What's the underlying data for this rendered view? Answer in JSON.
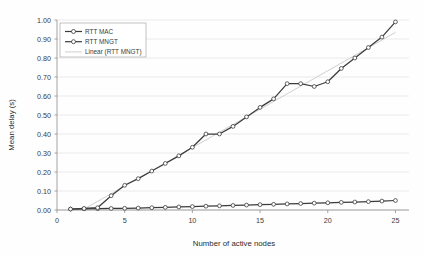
{
  "chart_data": {
    "type": "line",
    "title": "",
    "xlabel": "Number of active nodes",
    "ylabel": "Mean delay (s)",
    "xlim": [
      0,
      26
    ],
    "ylim": [
      0.0,
      1.0
    ],
    "xticks": [
      0,
      5,
      10,
      15,
      20,
      25
    ],
    "xtick_labels": [
      "0",
      "5",
      "10",
      "15",
      "20",
      "25"
    ],
    "yticks": [
      0.0,
      0.1,
      0.2,
      0.3,
      0.4,
      0.5,
      0.6,
      0.7,
      0.8,
      0.9,
      1.0
    ],
    "ytick_labels": [
      "0.00",
      "0.10",
      "0.20",
      "0.30",
      "0.40",
      "0.50",
      "0.60",
      "0.70",
      "0.80",
      "0.90",
      "1.00"
    ],
    "grid": true,
    "grid_axis": "y",
    "legend_position": "upper-left-inside",
    "x": [
      1,
      2,
      3,
      4,
      5,
      6,
      7,
      8,
      9,
      10,
      11,
      12,
      13,
      14,
      15,
      16,
      17,
      18,
      19,
      20,
      21,
      22,
      23,
      24,
      25
    ],
    "series": [
      {
        "name": "RTT MAC",
        "color": "#3b3b3b",
        "marker": "open-circle",
        "values": [
          0.005,
          0.006,
          0.007,
          0.008,
          0.009,
          0.01,
          0.012,
          0.014,
          0.016,
          0.018,
          0.02,
          0.022,
          0.024,
          0.026,
          0.028,
          0.03,
          0.032,
          0.034,
          0.036,
          0.038,
          0.04,
          0.042,
          0.044,
          0.047,
          0.05
        ]
      },
      {
        "name": "RTT MNGT",
        "color": "#3b3b3b",
        "marker": "open-circle",
        "values": [
          0.005,
          0.008,
          0.012,
          0.075,
          0.13,
          0.165,
          0.205,
          0.245,
          0.285,
          0.33,
          0.4,
          0.4,
          0.44,
          0.49,
          0.54,
          0.585,
          0.665,
          0.665,
          0.65,
          0.675,
          0.745,
          0.8,
          0.855,
          0.91,
          0.99
        ]
      }
    ],
    "trendline": {
      "name": "Linear (RTT MNGT)",
      "color": "#c9c9c9",
      "style": "thin-solid",
      "x_start": 2.0,
      "y_start": 0.005,
      "x_end": 25.0,
      "y_end": 0.935
    }
  },
  "legend": {
    "items": [
      {
        "label": "RTT MAC",
        "kind": "line-marker"
      },
      {
        "label": "RTT MNGT",
        "kind": "line-marker"
      },
      {
        "label": "Linear (RTT MNGT)",
        "kind": "thin-line"
      }
    ]
  }
}
